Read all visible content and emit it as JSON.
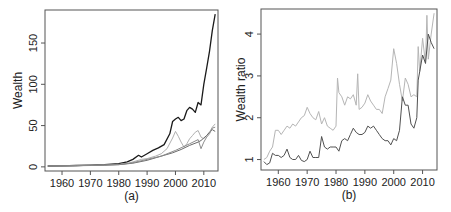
{
  "chart_data": [
    {
      "panel": "(a)",
      "type": "line",
      "title": "",
      "xlabel": "",
      "ylabel": "Wealth",
      "caption": "(a)",
      "xlim": [
        1954,
        2015
      ],
      "ylim": [
        -5,
        190
      ],
      "x_ticks": [
        1960,
        1970,
        1980,
        1990,
        2000,
        2010
      ],
      "y_ticks": [
        0,
        50,
        100,
        150
      ],
      "grid": false,
      "legend": null,
      "series": [
        {
          "name": "series-1 (black)",
          "color": "#1a1a1a",
          "x": [
            1955,
            1960,
            1965,
            1970,
            1975,
            1980,
            1983,
            1985,
            1987,
            1988,
            1990,
            1992,
            1994,
            1996,
            1998,
            1999,
            2000,
            2001,
            2002,
            2003,
            2004,
            2005,
            2006,
            2007,
            2008,
            2009,
            2010,
            2011,
            2012,
            2013,
            2014
          ],
          "values": [
            1,
            1.3,
            1.7,
            2.2,
            2.8,
            4,
            6,
            9,
            14,
            12,
            16,
            20,
            23,
            27,
            40,
            55,
            58,
            60,
            56,
            58,
            68,
            72,
            70,
            66,
            78,
            75,
            100,
            120,
            140,
            165,
            185
          ]
        },
        {
          "name": "series-2 (light gray)",
          "color": "#b0b0b0",
          "x": [
            1955,
            1960,
            1965,
            1970,
            1975,
            1980,
            1983,
            1985,
            1988,
            1990,
            1993,
            1995,
            1997,
            1999,
            2000,
            2001,
            2002,
            2003,
            2004,
            2005,
            2006,
            2007,
            2008,
            2009,
            2010,
            2011,
            2012,
            2013,
            2014
          ],
          "values": [
            1,
            1.2,
            1.5,
            1.9,
            2.3,
            3,
            4,
            6,
            9,
            10,
            13,
            16,
            22,
            35,
            43,
            37,
            30,
            24,
            28,
            34,
            38,
            42,
            44,
            36,
            34,
            38,
            42,
            48,
            52
          ]
        },
        {
          "name": "series-3 (medium gray)",
          "color": "#6a6a6a",
          "x": [
            1955,
            1960,
            1965,
            1970,
            1975,
            1980,
            1985,
            1990,
            1993,
            1996,
            1999,
            2002,
            2005,
            2008,
            2009,
            2010,
            2011,
            2012,
            2013,
            2014
          ],
          "values": [
            1,
            1.2,
            1.4,
            1.7,
            2.1,
            2.6,
            4.5,
            8,
            11,
            14,
            17,
            21,
            26,
            30,
            32,
            35,
            38,
            42,
            45,
            43
          ]
        },
        {
          "name": "series-4 (gray)",
          "color": "#8c8c8c",
          "x": [
            1955,
            1960,
            1965,
            1970,
            1975,
            1980,
            1985,
            1990,
            1995,
            2000,
            2005,
            2008,
            2009,
            2010,
            2011,
            2012,
            2013,
            2014
          ],
          "values": [
            1,
            1.2,
            1.5,
            1.8,
            2.2,
            2.8,
            5,
            9,
            13,
            20,
            28,
            33,
            22,
            30,
            36,
            40,
            47,
            48
          ]
        }
      ]
    },
    {
      "panel": "(b)",
      "type": "line",
      "title": "",
      "xlabel": "",
      "ylabel": "Wealth ratio",
      "caption": "(b)",
      "xlim": [
        1954,
        2015
      ],
      "ylim": [
        0.75,
        4.6
      ],
      "x_ticks": [
        1960,
        1970,
        1980,
        1990,
        2000,
        2010
      ],
      "y_ticks": [
        1,
        2,
        3,
        4
      ],
      "grid": false,
      "legend": null,
      "series": [
        {
          "name": "ratio-1 (light gray)",
          "color": "#b5b5b5",
          "x": [
            1955,
            1956,
            1957,
            1958,
            1959,
            1960,
            1961,
            1962,
            1963,
            1964,
            1965,
            1966,
            1967,
            1968,
            1969,
            1970,
            1971,
            1972,
            1973,
            1974,
            1975,
            1976,
            1977,
            1978,
            1979,
            1980,
            1980.5,
            1981,
            1982,
            1983,
            1984,
            1985,
            1986,
            1987,
            1987.5,
            1988,
            1989,
            1990,
            1991,
            1992,
            1993,
            1994,
            1995,
            1996,
            1997,
            1998,
            1999,
            2000,
            2001,
            2002,
            2003,
            2004,
            2005,
            2006,
            2007,
            2008,
            2008.5,
            2009,
            2010,
            2011,
            2011.5,
            2012,
            2013,
            2014
          ],
          "values": [
            1.0,
            1.05,
            1.2,
            1.3,
            1.7,
            1.7,
            1.6,
            1.7,
            1.8,
            1.75,
            1.85,
            1.8,
            1.9,
            2.0,
            2.05,
            2.25,
            2.1,
            2.0,
            1.95,
            2.15,
            1.85,
            2.0,
            1.8,
            1.75,
            1.7,
            1.8,
            2.95,
            2.6,
            2.5,
            2.3,
            2.5,
            2.45,
            2.55,
            2.3,
            3.05,
            2.2,
            2.25,
            2.35,
            2.55,
            2.4,
            2.3,
            2.2,
            2.2,
            2.1,
            2.5,
            2.7,
            2.9,
            3.65,
            3.3,
            2.8,
            2.4,
            2.95,
            2.8,
            2.5,
            2.55,
            2.5,
            3.7,
            3.1,
            3.9,
            3.3,
            4.45,
            3.4,
            4.0,
            4.5
          ]
        },
        {
          "name": "ratio-2 (dark gray)",
          "color": "#505050",
          "x": [
            1955,
            1956,
            1957,
            1958,
            1959,
            1960,
            1961,
            1962,
            1963,
            1964,
            1965,
            1966,
            1967,
            1968,
            1969,
            1970,
            1971,
            1972,
            1973,
            1974,
            1975,
            1976,
            1977,
            1978,
            1979,
            1980,
            1981,
            1982,
            1983,
            1984,
            1985,
            1986,
            1987,
            1988,
            1989,
            1990,
            1991,
            1992,
            1993,
            1994,
            1995,
            1996,
            1997,
            1998,
            1999,
            2000,
            2001,
            2002,
            2003,
            2004,
            2005,
            2006,
            2007,
            2008,
            2008.5,
            2009,
            2010,
            2011,
            2012,
            2013,
            2014
          ],
          "values": [
            0.95,
            0.88,
            0.92,
            1.15,
            1.1,
            1.1,
            1.05,
            1.1,
            1.25,
            1.05,
            1.0,
            1.0,
            1.1,
            0.98,
            0.95,
            1.0,
            1.2,
            1.05,
            1.05,
            1.05,
            1.55,
            1.3,
            1.25,
            1.3,
            1.3,
            1.3,
            1.2,
            1.45,
            1.5,
            1.45,
            1.6,
            1.75,
            1.65,
            1.6,
            1.6,
            1.65,
            1.8,
            1.75,
            1.8,
            1.7,
            1.6,
            1.5,
            1.45,
            1.45,
            1.35,
            1.5,
            1.45,
            1.7,
            2.5,
            2.3,
            2.3,
            1.85,
            1.75,
            2.0,
            2.9,
            3.1,
            3.5,
            3.3,
            4.0,
            3.8,
            3.65
          ]
        }
      ]
    }
  ]
}
